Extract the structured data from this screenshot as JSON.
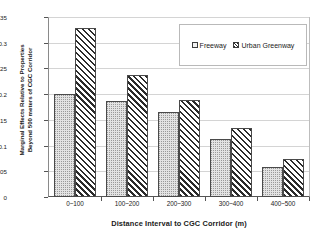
{
  "chart_data": {
    "type": "bar",
    "title": "",
    "subtitle": "",
    "xlabel": "Distance Interval to CGC Corridor (m)",
    "ylabel_line1": "Marginal Effects Relative to Properties",
    "ylabel_line2": "Beyond 500 meters of CGC Corridor",
    "categories": [
      "0~100",
      "100~200",
      "200~300",
      "300~400",
      "400~500"
    ],
    "series": [
      {
        "name": "Freeway",
        "values": [
          0.202,
          0.187,
          0.167,
          0.114,
          0.058
        ],
        "swatch": "light-dotted"
      },
      {
        "name": "Urban Greenway",
        "values": [
          0.33,
          0.238,
          0.189,
          0.134,
          0.074
        ],
        "swatch": "diagonal-hatch"
      }
    ],
    "ylim": [
      0,
      0.35
    ],
    "yticks": [
      0,
      0.05,
      0.1,
      0.15,
      0.2,
      0.25,
      0.3,
      0.35
    ],
    "ytick_labels": [
      "0",
      "0.05",
      "0.1",
      "0.15",
      "0.2",
      "0.25",
      "0.3",
      "0.35"
    ],
    "grid": true,
    "grid_axis": "y",
    "legend_position": "top-right-inside",
    "colors": {
      "freeway_fill": "#e3e3e3",
      "greenway_hatch": "#2b2b2b",
      "bar_border": "#4a4a4a",
      "gridline": "#d4d4d4",
      "axis": "#555555",
      "background": "#ffffff",
      "text": "#1a1a1a"
    }
  }
}
